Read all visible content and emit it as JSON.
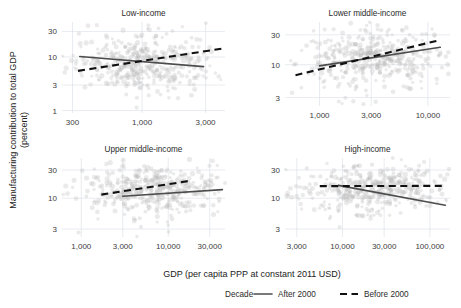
{
  "chart_data": {
    "type": "scatter",
    "title": "",
    "xlabel": "GDP (per capita PPP at constant 2011 USD)",
    "ylabel_line1": "Manufacturing contribution to total GDP",
    "ylabel_line2": "(percent)",
    "xscale": "log",
    "yscale": "log",
    "grid": true,
    "legend_position": "bottom",
    "legend_title": "Decade",
    "legend_entries": [
      {
        "label": "After 2000",
        "style": "solid",
        "color": "#4d4d4d"
      },
      {
        "label": "Before 2000",
        "style": "dashed",
        "color": "#111111"
      }
    ],
    "panels": [
      {
        "name": "low-income",
        "title": "Low-income",
        "xticks": [
          300,
          1000,
          3000
        ],
        "xtick_labels": [
          "300",
          "1,000",
          "3,000"
        ],
        "yticks": [
          1,
          3,
          10,
          30
        ],
        "ytick_labels": [
          "1",
          "3",
          "10",
          "30"
        ],
        "xlim": [
          250,
          4200
        ],
        "ylim": [
          0.9,
          45
        ],
        "series": [
          {
            "name": "After 2000",
            "style": "solid",
            "x": [
              340,
              2900
            ],
            "y": [
              10.2,
              6.6
            ]
          },
          {
            "name": "Before 2000",
            "style": "dashed",
            "x": [
              330,
              4100
            ],
            "y": [
              5.5,
              14.5
            ]
          }
        ],
        "n_points": 420,
        "cloud_center_x": 1050,
        "cloud_center_y": 8.0
      },
      {
        "name": "lower-middle-income",
        "title": "Lower middle-income",
        "xticks": [
          1000,
          3000,
          10000
        ],
        "xtick_labels": [
          "1,000",
          "3,000",
          "10,000"
        ],
        "yticks": [
          3,
          10,
          30
        ],
        "ytick_labels": [
          "3",
          "10",
          "30"
        ],
        "xlim": [
          480,
          16000
        ],
        "ylim": [
          2.2,
          48
        ],
        "series": [
          {
            "name": "After 2000",
            "style": "solid",
            "x": [
              1000,
              13000
            ],
            "y": [
              9.6,
              19.0
            ]
          },
          {
            "name": "Before 2000",
            "style": "dashed",
            "x": [
              600,
              12000
            ],
            "y": [
              6.8,
              24.0
            ]
          }
        ],
        "n_points": 430,
        "cloud_center_x": 3200,
        "cloud_center_y": 13.0
      },
      {
        "name": "upper-middle-income",
        "title": "Upper middle-income",
        "xticks": [
          1000,
          3000,
          10000,
          30000
        ],
        "xtick_labels": [
          "1,000",
          "3,000",
          "10,000",
          "30,000"
        ],
        "yticks": [
          3,
          10,
          30
        ],
        "ytick_labels": [
          "3",
          "10",
          "30"
        ],
        "xlim": [
          600,
          45000
        ],
        "ylim": [
          2.2,
          48
        ],
        "series": [
          {
            "name": "After 2000",
            "style": "solid",
            "x": [
              3000,
              42000
            ],
            "y": [
              10.8,
              14.0
            ]
          },
          {
            "name": "Before 2000",
            "style": "dashed",
            "x": [
              1700,
              17000
            ],
            "y": [
              11.5,
              19.5
            ]
          }
        ],
        "n_points": 430,
        "cloud_center_x": 7000,
        "cloud_center_y": 13.5
      },
      {
        "name": "high-income",
        "title": "High-income",
        "xticks": [
          3000,
          10000,
          30000,
          100000
        ],
        "xtick_labels": [
          "3,000",
          "10,000",
          "30,000",
          "100,000"
        ],
        "yticks": [
          3,
          10,
          30
        ],
        "ytick_labels": [
          "3",
          "10",
          "30"
        ],
        "xlim": [
          2200,
          170000
        ],
        "ylim": [
          2.2,
          48
        ],
        "series": [
          {
            "name": "After 2000",
            "style": "solid",
            "x": [
              9000,
              150000
            ],
            "y": [
              16.5,
              7.6
            ]
          },
          {
            "name": "Before 2000",
            "style": "dashed",
            "x": [
              5500,
              150000
            ],
            "y": [
              16.0,
              16.2
            ]
          }
        ],
        "n_points": 430,
        "cloud_center_x": 22000,
        "cloud_center_y": 14.0
      }
    ]
  }
}
